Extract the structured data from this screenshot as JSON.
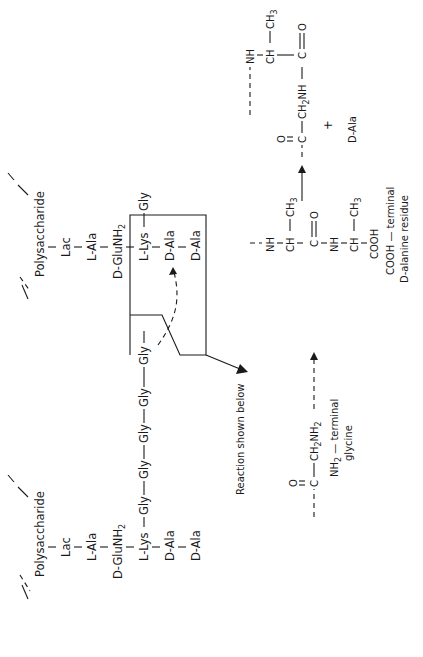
{
  "figure": {
    "orientation": "rotated-90-ccw",
    "left_structure": {
      "polysaccharide": "Polysaccharide",
      "lac": "Lac",
      "l_ala": "L-Ala",
      "d_glu": "D-GluNH",
      "d_glu_sub": "2",
      "l_lys": "L-Lys",
      "d_ala_1": "D-Ala",
      "d_ala_2": "D-Ala",
      "gly_bridge": [
        "Gly",
        "Gly",
        "Gly",
        "Gly",
        "Gly"
      ]
    },
    "right_structure": {
      "polysaccharide": "Polysaccharide",
      "lac": "Lac",
      "l_ala": "L-Ala",
      "d_glu": "D-GluNH",
      "d_glu_sub": "2",
      "l_lys": "L-Lys",
      "gly": "Gly",
      "d_ala_1": "D-Ala",
      "d_ala_2": "D-Ala"
    },
    "callout_label": "Reaction shown below",
    "reaction": {
      "glycine": {
        "carbonyl_o": "O",
        "c": "C",
        "ch2nh2": "CH",
        "ch2nh2_sub": "2",
        "ch2nh2_tail": "NH",
        "ch2nh2_tail_sub": "2",
        "label_line1": "NH",
        "label_line1_sub": "2",
        "label_line1_tail": " — terminal",
        "label_line2": "glycine"
      },
      "alanine": {
        "nh1": "NH",
        "ch1": "CH",
        "ch3_1": "CH",
        "ch3_1_sub": "3",
        "co": "C",
        "co_o": "O",
        "nh2": "NH",
        "ch2": "CH",
        "ch3_2": "CH",
        "ch3_2_sub": "3",
        "cooh": "COOH",
        "label_line1": "COOH — terminal",
        "label_line2": "D-alanine residue"
      },
      "product": {
        "carbonyl_o": "O",
        "c": "C",
        "ch2nh": "CH",
        "ch2nh_sub": "2",
        "ch2nh_tail": "NH",
        "nh": "NH",
        "ch": "CH",
        "ch3": "CH",
        "ch3_sub": "3",
        "co": "C",
        "co_o": "O"
      },
      "plus": "+",
      "released": "D-Ala"
    }
  }
}
